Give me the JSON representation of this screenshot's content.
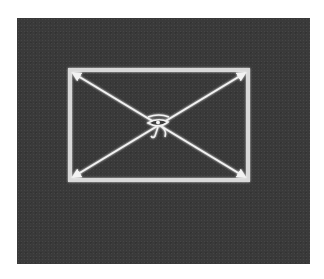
{
  "figure": {
    "colors": {
      "background": "#ffffff",
      "panel": "#3a3a3a",
      "lines": "#f2f2f2",
      "frame": "#d9d9d9"
    },
    "rectangle": {
      "x1": 70,
      "y1": 70,
      "x2": 248,
      "y2": 180
    },
    "vertical_axis": {
      "x": 159,
      "y_top": 20,
      "y_bottom": 232
    },
    "center": {
      "x": 159,
      "y": 125
    },
    "center_symbol": "eye-of-horus-icon",
    "center_glyph": "𓂀"
  }
}
